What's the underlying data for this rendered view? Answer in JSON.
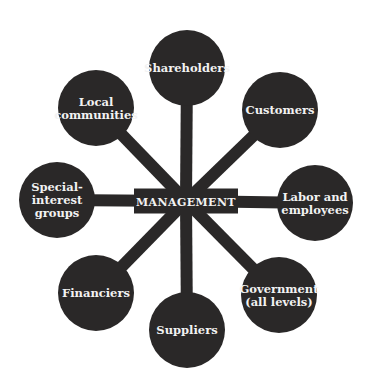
{
  "diagram": {
    "type": "hub-and-spoke stakeholder diagram",
    "colors": {
      "background": "#ffffff",
      "fill": "#2a2828",
      "text": "#f2f2f2"
    },
    "center": {
      "label": "MANAGEMENT",
      "x": 186,
      "y": 201,
      "width": 104,
      "height": 25
    },
    "nodes": [
      {
        "id": "shareholders",
        "lines": [
          "Shareholders"
        ],
        "x": 187,
        "y": 68
      },
      {
        "id": "customers",
        "lines": [
          "Customers"
        ],
        "x": 280,
        "y": 110
      },
      {
        "id": "labor",
        "lines": [
          "Labor and",
          "employees"
        ],
        "x": 315,
        "y": 203
      },
      {
        "id": "government",
        "lines": [
          "Government",
          "(all levels)"
        ],
        "x": 279,
        "y": 295
      },
      {
        "id": "suppliers",
        "lines": [
          "Suppliers"
        ],
        "x": 187,
        "y": 330
      },
      {
        "id": "financiers",
        "lines": [
          "Financiers"
        ],
        "x": 96,
        "y": 293
      },
      {
        "id": "special-interest",
        "lines": [
          "Special-",
          "interest",
          "groups"
        ],
        "x": 57,
        "y": 200
      },
      {
        "id": "local-communities",
        "lines": [
          "Local",
          "communities"
        ],
        "x": 96,
        "y": 108
      }
    ],
    "node_radius": 38,
    "spoke_width": 12
  }
}
